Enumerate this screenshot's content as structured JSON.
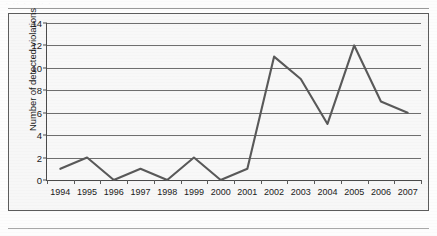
{
  "page": {
    "top_stub_text": "· ·· · · ·· ·",
    "background_color": "#fdfdfd",
    "rule_color": "#9a9a9a"
  },
  "chart_data": {
    "type": "line",
    "title": "",
    "xlabel": "",
    "ylabel": "Number of detected violations",
    "categories": [
      "1994",
      "1995",
      "1996",
      "1997",
      "1998",
      "1999",
      "2000",
      "2001",
      "2002",
      "2003",
      "2004",
      "2005",
      "2006",
      "2007"
    ],
    "values": [
      1,
      2,
      0,
      1,
      0,
      2,
      0,
      1,
      11,
      9,
      5,
      12,
      7,
      6
    ],
    "ylim": [
      0,
      14
    ],
    "ytick_labels": [
      "0",
      "2",
      "4",
      "6",
      "8",
      "10",
      "12",
      "14"
    ],
    "ytick_values": [
      0,
      2,
      4,
      6,
      8,
      10,
      12,
      14
    ],
    "grid": true,
    "legend": "none",
    "series_color": "#595959",
    "gridline_color": "#6e6e6e",
    "axis_color": "#4a4a4a",
    "plot_background": "#f8f8f8",
    "frame_border_color": "#5c5c5c"
  }
}
